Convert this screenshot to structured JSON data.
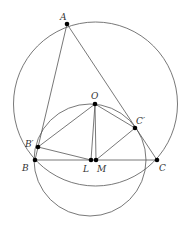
{
  "diagram": {
    "type": "geometry",
    "points": [
      {
        "id": "A",
        "label": "A",
        "x": 67,
        "y": 24,
        "lx": 60,
        "ly": 20
      },
      {
        "id": "O",
        "label": "O",
        "x": 95,
        "y": 104,
        "lx": 91,
        "ly": 99
      },
      {
        "id": "Bp",
        "label": "B′",
        "x": 38,
        "y": 147,
        "lx": 25,
        "ly": 147
      },
      {
        "id": "Cp",
        "label": "C′",
        "x": 135,
        "y": 128,
        "lx": 136,
        "ly": 124
      },
      {
        "id": "B",
        "label": "B",
        "x": 35,
        "y": 160,
        "lx": 22,
        "ly": 171
      },
      {
        "id": "L",
        "label": "L",
        "x": 91,
        "y": 160,
        "lx": 83,
        "ly": 172
      },
      {
        "id": "M",
        "label": "M",
        "x": 96,
        "y": 160,
        "lx": 97,
        "ly": 172
      },
      {
        "id": "C",
        "label": "C",
        "x": 157,
        "y": 160,
        "lx": 159,
        "ly": 171
      }
    ],
    "segments": [
      [
        "A",
        "B"
      ],
      [
        "A",
        "C"
      ],
      [
        "B",
        "C"
      ],
      [
        "O",
        "Bp"
      ],
      [
        "O",
        "Cp"
      ],
      [
        "O",
        "L"
      ],
      [
        "O",
        "M"
      ],
      [
        "Bp",
        "L"
      ],
      [
        "Cp",
        "M"
      ]
    ],
    "circles": [
      {
        "name": "circumcircle",
        "cx": 95.5,
        "cy": 104,
        "r": 82
      },
      {
        "name": "small-circle",
        "cx": 90,
        "cy": 160,
        "r": 56
      }
    ],
    "colors": {
      "stroke": "#555555",
      "point": "#000000",
      "label": "#333333"
    }
  }
}
